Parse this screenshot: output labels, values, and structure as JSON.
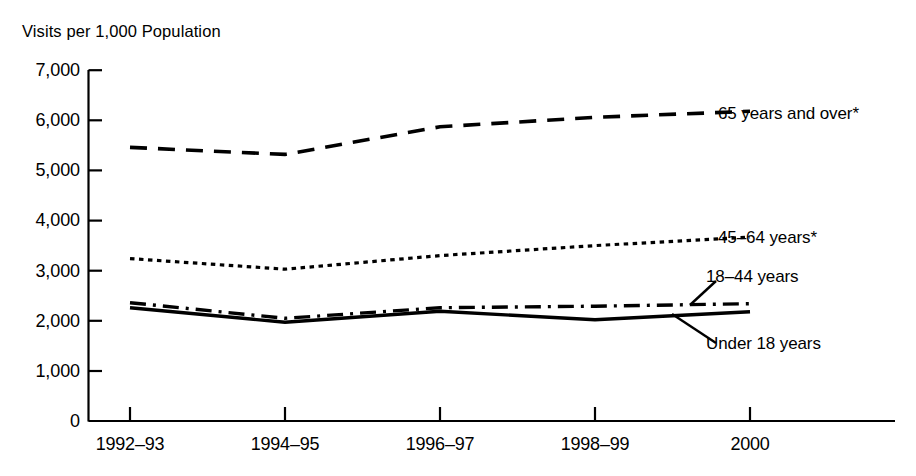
{
  "chart_data": {
    "type": "line",
    "title": "",
    "ylabel": "Visits per 1,000 Population",
    "xlabel": "",
    "ylim": [
      0,
      7000
    ],
    "ytick_labels": [
      "0",
      "1,000",
      "2,000",
      "3,000",
      "4,000",
      "5,000",
      "6,000",
      "7,000"
    ],
    "ytick_values": [
      0,
      1000,
      2000,
      3000,
      4000,
      5000,
      6000,
      7000
    ],
    "categories": [
      "1992-93",
      "1994-95",
      "1996-97",
      "1998-99",
      "2000"
    ],
    "grid": false,
    "legend_position": "right-inline-labels",
    "footnote_marker": "*",
    "series": [
      {
        "name": "65 years and over*",
        "label": "65 years and over*",
        "style": "long-dashed",
        "values": [
          5460,
          5320,
          5870,
          6060,
          6180
        ]
      },
      {
        "name": "45-64 years*",
        "label": "45–64 years*",
        "style": "dotted",
        "values": [
          3240,
          3030,
          3300,
          3500,
          3670
        ]
      },
      {
        "name": "18-44 years",
        "label": "18–44 years",
        "style": "dash-dot",
        "values": [
          2360,
          2050,
          2260,
          2290,
          2340
        ]
      },
      {
        "name": "Under 18 years",
        "label": "Under 18 years",
        "style": "solid",
        "values": [
          2260,
          1970,
          2190,
          2020,
          2180
        ]
      }
    ]
  },
  "axis": {
    "y_label_text": "Visits per 1,000 Population"
  },
  "xticks": [
    "1992–93",
    "1994–95",
    "1996–97",
    "1998–99",
    "2000"
  ],
  "yticks": [
    "7,000",
    "6,000",
    "5,000",
    "4,000",
    "3,000",
    "2,000",
    "1,000",
    "0"
  ],
  "labels": {
    "s65": "65 years and over*",
    "s45": "45–64 years*",
    "s18": "18–44 years",
    "sunder": "Under 18 years"
  }
}
